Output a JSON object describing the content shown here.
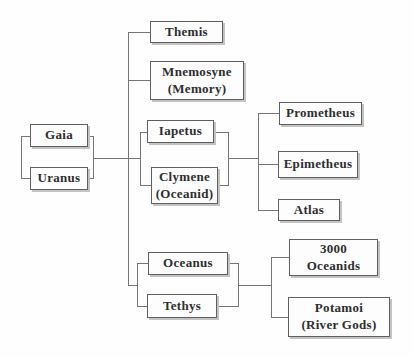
{
  "diagram": {
    "type": "family-tree",
    "nodes": {
      "gaia": {
        "label": "Gaia"
      },
      "uranus": {
        "label": "Uranus"
      },
      "themis": {
        "label": "Themis"
      },
      "mnemosyne": {
        "label": "Mnemosyne",
        "sublabel": "(Memory)"
      },
      "iapetus": {
        "label": "Iapetus"
      },
      "clymene": {
        "label": "Clymene",
        "sublabel": "(Oceanid)"
      },
      "prometheus": {
        "label": "Prometheus"
      },
      "epimetheus": {
        "label": "Epimetheus"
      },
      "atlas": {
        "label": "Atlas"
      },
      "oceanus": {
        "label": "Oceanus"
      },
      "tethys": {
        "label": "Tethys"
      },
      "oceanids": {
        "label": "3000",
        "sublabel": "Oceanids"
      },
      "potamoi": {
        "label": "Potamoi",
        "sublabel": "(River Gods)"
      }
    },
    "families": [
      {
        "parents": [
          "Gaia",
          "Uranus"
        ],
        "children": [
          "Themis",
          "Mnemosyne (Memory)",
          "Iapetus",
          "Oceanus",
          "Tethys"
        ]
      },
      {
        "parents": [
          "Iapetus",
          "Clymene (Oceanid)"
        ],
        "children": [
          "Prometheus",
          "Epimetheus",
          "Atlas"
        ]
      },
      {
        "parents": [
          "Oceanus",
          "Tethys"
        ],
        "children": [
          "3000 Oceanids",
          "Potamoi (River Gods)"
        ]
      }
    ],
    "colors": {
      "background": "#fefefe",
      "box_fill": "#fdfdfd",
      "box_border": "#5f5f5f",
      "box_shadow": "#c3c3c3",
      "line": "#757575",
      "text": "#2e2e2e"
    }
  }
}
